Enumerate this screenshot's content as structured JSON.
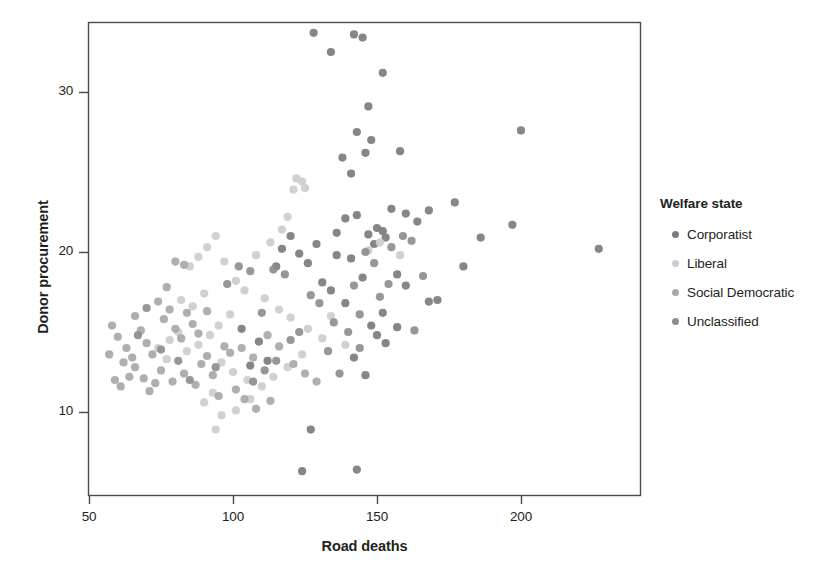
{
  "chart_data": {
    "type": "scatter",
    "title": "",
    "xlabel": "Road deaths",
    "ylabel": "Donor procurement",
    "xlim": [
      45,
      236
    ],
    "ylim": [
      4.2,
      35.2
    ],
    "xticks": [
      50,
      100,
      150,
      200
    ],
    "yticks": [
      10,
      20,
      30
    ],
    "grid": false,
    "legend_title": "Welfare state",
    "legend_position": "right",
    "series": [
      {
        "name": "Corporatist",
        "color": "#7c7c7c",
        "points": [
          [
            128,
            33.7
          ],
          [
            142,
            33.6
          ],
          [
            145,
            33.4
          ],
          [
            134,
            32.5
          ],
          [
            152,
            31.2
          ],
          [
            147,
            29.1
          ],
          [
            143,
            27.5
          ],
          [
            200,
            27.6
          ],
          [
            158,
            26.3
          ],
          [
            148,
            27.0
          ],
          [
            146,
            26.2
          ],
          [
            138,
            25.9
          ],
          [
            141,
            24.9
          ],
          [
            177,
            23.1
          ],
          [
            155,
            22.7
          ],
          [
            168,
            22.6
          ],
          [
            160,
            22.4
          ],
          [
            197,
            21.7
          ],
          [
            186,
            20.9
          ],
          [
            227,
            20.2
          ],
          [
            150,
            21.5
          ],
          [
            152,
            21.3
          ],
          [
            147,
            21.1
          ],
          [
            153,
            20.9
          ],
          [
            149,
            20.5
          ],
          [
            143,
            22.3
          ],
          [
            139,
            22.1
          ],
          [
            136,
            21.2
          ],
          [
            129,
            20.5
          ],
          [
            164,
            21.9
          ],
          [
            180,
            19.1
          ],
          [
            171,
            17.0
          ],
          [
            168,
            16.9
          ],
          [
            157,
            15.3
          ],
          [
            152,
            16.2
          ],
          [
            148,
            15.4
          ],
          [
            142,
            13.4
          ],
          [
            139,
            16.8
          ],
          [
            134,
            17.6
          ],
          [
            131,
            18.1
          ],
          [
            126,
            19.3
          ],
          [
            123,
            19.9
          ],
          [
            120,
            21.0
          ],
          [
            117,
            20.2
          ],
          [
            115,
            19.1
          ],
          [
            157,
            18.6
          ],
          [
            160,
            17.9
          ],
          [
            145,
            18.4
          ],
          [
            141,
            19.6
          ],
          [
            136,
            19.8
          ],
          [
            150,
            14.8
          ],
          [
            153,
            14.3
          ],
          [
            146,
            12.3
          ],
          [
            143,
            6.4
          ],
          [
            124,
            6.3
          ],
          [
            127,
            8.9
          ],
          [
            112,
            13.2
          ],
          [
            109,
            14.4
          ],
          [
            106,
            12.9
          ],
          [
            103,
            15.2
          ]
        ]
      },
      {
        "name": "Liberal",
        "color": "#cdcdcd",
        "points": [
          [
            122,
            24.6
          ],
          [
            124,
            24.4
          ],
          [
            121,
            23.9
          ],
          [
            125,
            24.0
          ],
          [
            119,
            22.2
          ],
          [
            117,
            21.4
          ],
          [
            113,
            20.6
          ],
          [
            108,
            19.8
          ],
          [
            94,
            21.0
          ],
          [
            91,
            20.3
          ],
          [
            97,
            19.4
          ],
          [
            88,
            19.7
          ],
          [
            85,
            19.1
          ],
          [
            101,
            18.2
          ],
          [
            104,
            17.6
          ],
          [
            111,
            17.1
          ],
          [
            116,
            16.4
          ],
          [
            120,
            15.9
          ],
          [
            126,
            15.2
          ],
          [
            131,
            14.6
          ],
          [
            99,
            16.1
          ],
          [
            95,
            15.4
          ],
          [
            92,
            14.8
          ],
          [
            88,
            14.2
          ],
          [
            84,
            13.8
          ],
          [
            81,
            15.0
          ],
          [
            78,
            14.5
          ],
          [
            96,
            13.1
          ],
          [
            100,
            12.5
          ],
          [
            105,
            12.0
          ],
          [
            110,
            11.6
          ],
          [
            114,
            12.2
          ],
          [
            93,
            11.2
          ],
          [
            90,
            10.6
          ],
          [
            96,
            9.8
          ],
          [
            94,
            8.9
          ],
          [
            101,
            10.1
          ],
          [
            106,
            10.8
          ],
          [
            119,
            12.8
          ],
          [
            124,
            13.6
          ],
          [
            134,
            16.0
          ],
          [
            139,
            14.2
          ],
          [
            147,
            20.1
          ],
          [
            151,
            20.6
          ],
          [
            158,
            19.8
          ],
          [
            86,
            16.6
          ],
          [
            82,
            17.0
          ],
          [
            90,
            17.4
          ],
          [
            77,
            13.3
          ],
          [
            74,
            14.0
          ]
        ]
      },
      {
        "name": "Social Democratic",
        "color": "#a8a8a8",
        "points": [
          [
            58,
            15.4
          ],
          [
            60,
            14.7
          ],
          [
            62,
            13.1
          ],
          [
            64,
            12.2
          ],
          [
            59,
            12.0
          ],
          [
            61,
            11.6
          ],
          [
            66,
            16.0
          ],
          [
            68,
            15.1
          ],
          [
            70,
            14.3
          ],
          [
            72,
            13.6
          ],
          [
            74,
            16.9
          ],
          [
            76,
            15.8
          ],
          [
            78,
            16.4
          ],
          [
            80,
            15.2
          ],
          [
            82,
            14.6
          ],
          [
            84,
            16.2
          ],
          [
            86,
            15.5
          ],
          [
            88,
            14.9
          ],
          [
            66,
            12.8
          ],
          [
            69,
            12.1
          ],
          [
            71,
            11.3
          ],
          [
            73,
            11.8
          ],
          [
            75,
            12.6
          ],
          [
            79,
            11.9
          ],
          [
            83,
            12.4
          ],
          [
            87,
            11.7
          ],
          [
            89,
            13.0
          ],
          [
            91,
            13.5
          ],
          [
            93,
            12.3
          ],
          [
            95,
            11.0
          ],
          [
            97,
            14.1
          ],
          [
            99,
            13.7
          ],
          [
            63,
            14.0
          ],
          [
            65,
            13.4
          ],
          [
            57,
            13.6
          ],
          [
            80,
            19.4
          ],
          [
            83,
            19.2
          ],
          [
            77,
            17.8
          ],
          [
            91,
            16.3
          ],
          [
            103,
            14.0
          ],
          [
            107,
            13.4
          ],
          [
            112,
            14.8
          ],
          [
            116,
            14.1
          ],
          [
            121,
            13.0
          ],
          [
            125,
            12.4
          ],
          [
            129,
            11.9
          ],
          [
            101,
            11.4
          ],
          [
            104,
            10.8
          ],
          [
            108,
            10.2
          ],
          [
            113,
            10.7
          ]
        ]
      },
      {
        "name": "Unclassified",
        "color": "#8e8e8e",
        "points": [
          [
            146,
            20.0
          ],
          [
            149,
            19.3
          ],
          [
            155,
            20.3
          ],
          [
            163,
            15.1
          ],
          [
            166,
            18.5
          ],
          [
            137,
            12.4
          ],
          [
            133,
            13.8
          ],
          [
            130,
            16.8
          ],
          [
            127,
            17.3
          ],
          [
            142,
            17.9
          ],
          [
            144,
            16.1
          ],
          [
            151,
            17.2
          ],
          [
            154,
            18.0
          ],
          [
            118,
            18.6
          ],
          [
            114,
            18.9
          ],
          [
            110,
            16.2
          ],
          [
            106,
            18.8
          ],
          [
            102,
            19.1
          ],
          [
            98,
            18.0
          ],
          [
            120,
            14.5
          ],
          [
            123,
            15.0
          ],
          [
            115,
            13.2
          ],
          [
            111,
            12.6
          ],
          [
            107,
            11.9
          ],
          [
            94,
            12.8
          ],
          [
            85,
            12.0
          ],
          [
            81,
            13.2
          ],
          [
            75,
            13.9
          ],
          [
            70,
            16.5
          ],
          [
            67,
            14.8
          ],
          [
            135,
            15.6
          ],
          [
            140,
            15.0
          ],
          [
            144,
            14.0
          ],
          [
            159,
            21.0
          ],
          [
            162,
            20.7
          ]
        ]
      }
    ]
  },
  "legend": {
    "title": "Welfare state",
    "items": [
      {
        "label": "Corporatist",
        "color": "#7c7c7c"
      },
      {
        "label": "Liberal",
        "color": "#cdcdcd"
      },
      {
        "label": "Social Democratic",
        "color": "#a8a8a8"
      },
      {
        "label": "Unclassified",
        "color": "#8e8e8e"
      }
    ]
  },
  "axes": {
    "x_label": "Road deaths",
    "y_label": "Donor procurement",
    "x_tick_labels": [
      "50",
      "100",
      "150",
      "200"
    ],
    "y_tick_labels": [
      "10",
      "20",
      "30"
    ],
    "frame_color": "#4a4a4a"
  }
}
